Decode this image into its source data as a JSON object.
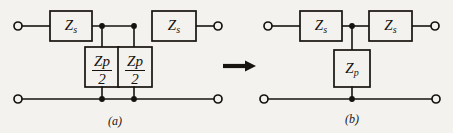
{
  "figure": {
    "background_color": "#f4f2ee",
    "line_color": "#16130f",
    "type": "circuit-diagram"
  },
  "diagram_a": {
    "caption": "(a)",
    "series_left_label": {
      "symbol": "Z",
      "subscript": "s"
    },
    "series_right_label": {
      "symbol": "Z",
      "subscript": "s"
    },
    "shunt_left_label": {
      "numerator_symbol": "Z",
      "numerator_subscript": "p",
      "denominator": "2"
    },
    "shunt_right_label": {
      "numerator_symbol": "Z",
      "numerator_subscript": "p",
      "denominator": "2"
    },
    "terminal_count": 4,
    "junction_count": 4
  },
  "diagram_b": {
    "caption": "(b)",
    "series_left_label": {
      "symbol": "Z",
      "subscript": "s"
    },
    "series_right_label": {
      "symbol": "Z",
      "subscript": "s"
    },
    "shunt_label": {
      "symbol": "Z",
      "subscript": "p"
    },
    "terminal_count": 4,
    "junction_count": 2
  },
  "transform_arrow": {
    "name": "rightwards-arrow",
    "glyph": "→"
  }
}
